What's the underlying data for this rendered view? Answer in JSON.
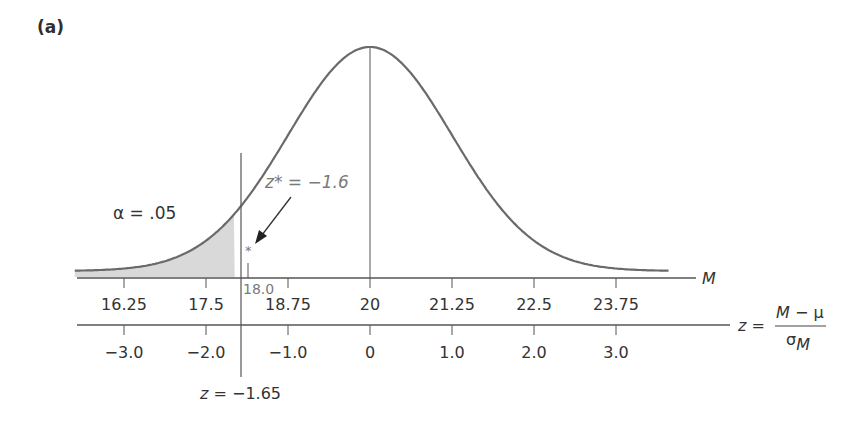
{
  "panel_label": "(a)",
  "annotations": {
    "alpha": "α = .05",
    "z_star": "z* = −1.6",
    "star_marker": "*",
    "sample_mean": "18.0",
    "critical_z": "z = −1.65"
  },
  "axes": {
    "m_axis_label": "M",
    "z_axis_label_lhs": "z =",
    "z_axis_numerator": "M − μ",
    "z_axis_denominator": "σ",
    "z_axis_denominator_sub": "M"
  },
  "colors": {
    "curve": "#6a6a6a",
    "shade": "#d9d9d9",
    "axis": "#555555",
    "annotation": "#7a7a7a"
  },
  "chart_data": {
    "type": "area",
    "title": "(a)",
    "distribution": {
      "mean": 20,
      "sd_M": 1.25
    },
    "m_ticks": [
      "16.25",
      "17.5",
      "18.75",
      "20",
      "21.25",
      "22.5",
      "23.75"
    ],
    "m_tick_values": [
      16.25,
      17.5,
      18.75,
      20,
      21.25,
      22.5,
      23.75
    ],
    "z_ticks": [
      "−3.0",
      "−2.0",
      "−1.0",
      "0",
      "1.0",
      "2.0",
      "3.0"
    ],
    "z_tick_values": [
      -3.0,
      -2.0,
      -1.0,
      0,
      1.0,
      2.0,
      3.0
    ],
    "xlabel_top": "M",
    "xlabel_bottom": "z = (M − μ) / σM",
    "shaded_region": {
      "from_z": -3.6,
      "to_z": -1.65,
      "area": 0.05,
      "label": "α = .05"
    },
    "critical_line": {
      "z": -1.65,
      "label": "z = −1.65"
    },
    "center_line": {
      "z": 0,
      "M": 20
    },
    "sample_point": {
      "M": 18.0,
      "z": -1.6,
      "label": "z* = −1.6"
    }
  }
}
